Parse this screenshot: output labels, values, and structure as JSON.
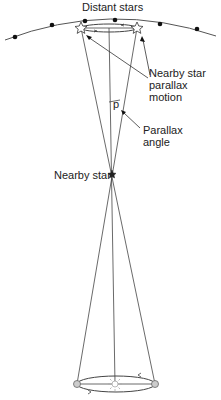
{
  "labels": {
    "distant_stars": "Distant stars",
    "parallax_motion": "Nearby star\nparallax\nmotion",
    "p": "p",
    "parallax_angle": "Parallax\nangle",
    "nearby_star": "Nearby star"
  },
  "colors": {
    "line": "#333333",
    "star_fill": "#ffffff",
    "earth_fill": "#cccccc",
    "sun": "#bbbbbb"
  }
}
